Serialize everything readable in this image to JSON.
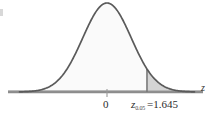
{
  "figure": {
    "name": "standard-normal-critical-value-curve",
    "axis_label": "z",
    "center_tick_label": "0",
    "critical_symbol": "z",
    "critical_subscript": "0.05",
    "critical_equals": "=1.645"
  },
  "colors": {
    "curve_stroke": "#5a5a5a",
    "axis_stroke": "#8c8c8c",
    "body_fill": "#fafafa",
    "tail_fill": "#d4d4d4",
    "text": "#2b2b2b",
    "background": "#ffffff"
  },
  "chart_data": {
    "type": "area",
    "title": "",
    "xlabel": "z",
    "ylabel": "",
    "distribution": "standard normal",
    "mean": 0,
    "sd": 1,
    "xlim": [
      -3.6,
      3.6
    ],
    "ylim": [
      0,
      0.4
    ],
    "grid": false,
    "legend": null,
    "tick_labels": [
      "0"
    ],
    "ticks": [
      0
    ],
    "annotations": [
      {
        "text": "z_{0.05} =1.645",
        "symbol": "z",
        "subscript": "0.05",
        "value": 1.645,
        "x": 1.645
      }
    ],
    "shaded_region": {
      "name": "right-tail-rejection-region",
      "from": 1.645,
      "to": 3.6,
      "area": 0.05,
      "fill": "#d4d4d4"
    },
    "x": [
      -3.6,
      -3.4,
      -3.2,
      -3.0,
      -2.8,
      -2.6,
      -2.4,
      -2.2,
      -2.0,
      -1.8,
      -1.6,
      -1.4,
      -1.2,
      -1.0,
      -0.8,
      -0.6,
      -0.4,
      -0.2,
      0.0,
      0.2,
      0.4,
      0.6,
      0.8,
      1.0,
      1.2,
      1.4,
      1.6,
      1.645,
      1.8,
      2.0,
      2.2,
      2.4,
      2.6,
      2.8,
      3.0,
      3.2,
      3.4,
      3.6
    ],
    "values": [
      0.0006,
      0.0012,
      0.0024,
      0.0044,
      0.0079,
      0.0136,
      0.0224,
      0.0355,
      0.054,
      0.079,
      0.1109,
      0.1497,
      0.1942,
      0.242,
      0.2897,
      0.3332,
      0.3683,
      0.391,
      0.3989,
      0.391,
      0.3683,
      0.3332,
      0.2897,
      0.242,
      0.1942,
      0.1497,
      0.1109,
      0.1031,
      0.079,
      0.054,
      0.0355,
      0.0224,
      0.0136,
      0.0079,
      0.0044,
      0.0024,
      0.0012,
      0.0006
    ]
  }
}
